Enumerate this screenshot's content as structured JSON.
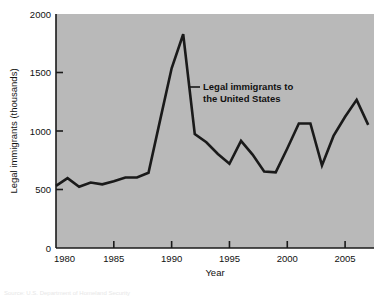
{
  "figure": {
    "background_color": "#ffffff",
    "plot_background_color": "#b9b9b9",
    "line_color": "#1a1a1a",
    "axis_color": "#1a1a1a"
  },
  "annotation": {
    "line1": "Legal immigrants to",
    "line2": "the United States"
  },
  "source_note": "Source: U.S. Department of Homeland Security",
  "chart_data": {
    "type": "line",
    "title": "",
    "subtitle": "",
    "xlabel": "Year",
    "ylabel": "Legal immigrants (thousands)",
    "xlim": [
      1980,
      2007.5
    ],
    "ylim": [
      0,
      2000
    ],
    "grid": false,
    "legend_position": "inline-annotation",
    "xticks": [
      1980,
      1985,
      1990,
      1995,
      2000,
      2005
    ],
    "xtick_labels": [
      "1980",
      "1985",
      "1990",
      "1995",
      "2000",
      "2005"
    ],
    "yticks": [
      0,
      500,
      1000,
      1500,
      2000
    ],
    "ytick_labels": [
      "0",
      "500",
      "1000",
      "1500",
      "2000"
    ],
    "annotations": [
      {
        "text": "Legal immigrants to the United States",
        "x": 1991.5,
        "y": 1280
      }
    ],
    "series": [
      {
        "name": "Legal immigrants to the United States",
        "color": "#1a1a1a",
        "x": [
          1980,
          1981,
          1982,
          1983,
          1984,
          1985,
          1986,
          1987,
          1988,
          1989,
          1990,
          1991,
          1992,
          1993,
          1994,
          1995,
          1996,
          1997,
          1998,
          1999,
          2000,
          2001,
          2002,
          2003,
          2004,
          2005,
          2006,
          2007
        ],
        "values": [
          531,
          597,
          524,
          560,
          544,
          570,
          602,
          602,
          643,
          1091,
          1536,
          1827,
          974,
          904,
          804,
          720,
          916,
          798,
          654,
          647,
          850,
          1064,
          1064,
          706,
          958,
          1122,
          1266,
          1052
        ]
      }
    ]
  }
}
